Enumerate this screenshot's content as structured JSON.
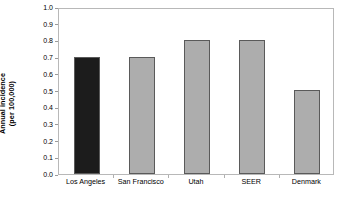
{
  "chart_data": {
    "type": "bar",
    "title": "",
    "subtitle": "",
    "xlabel": "",
    "ylabel": "Annual incidence (per 100,000)",
    "ylabel_line1": "Annual incidence",
    "ylabel_line2": "(per 100,000)",
    "categories": [
      "Los Angeles",
      "San Francisco",
      "Utah",
      "SEER",
      "Denmark"
    ],
    "values": [
      0.7,
      0.7,
      0.8,
      0.8,
      0.5
    ],
    "ylim": [
      0.0,
      1.0
    ],
    "ytick_labels": [
      "1.0",
      "0.9",
      "0.8",
      "0.7",
      "0.6",
      "0.5",
      "0.4",
      "0.3",
      "0.2",
      "0.1",
      "0.0"
    ],
    "ytick_values": [
      1.0,
      0.9,
      0.8,
      0.7,
      0.6,
      0.5,
      0.4,
      0.3,
      0.2,
      0.1,
      0.0
    ],
    "grid": false,
    "legend": "none",
    "bar_colors": [
      "#1c1c1c",
      "#adadad",
      "#adadad",
      "#adadad",
      "#adadad"
    ],
    "bar_border_color": "#5a5a5a",
    "plot_border_color": "#b8b8b8",
    "background_color": "#ffffff"
  }
}
